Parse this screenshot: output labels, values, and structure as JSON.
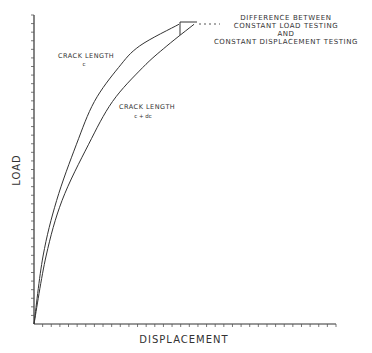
{
  "chart_data": {
    "type": "line",
    "title": "",
    "xlabel": "DISPLACEMENT",
    "ylabel": "LOAD",
    "xlim": [
      0,
      1
    ],
    "ylim": [
      0,
      1
    ],
    "grid": false,
    "x_tick_count": 35,
    "y_tick_count": 36,
    "series": [
      {
        "name": "crack-length-c",
        "label_line1": "CRACK LENGTH",
        "label_line2": "c",
        "points": [
          [
            0,
            0
          ],
          [
            0.03,
            0.22
          ],
          [
            0.075,
            0.4
          ],
          [
            0.14,
            0.58
          ],
          [
            0.2,
            0.72
          ],
          [
            0.28,
            0.83
          ],
          [
            0.35,
            0.9
          ],
          [
            0.48,
            0.97
          ]
        ]
      },
      {
        "name": "crack-length-c-plus-dc",
        "label_line1": "CRACK LENGTH",
        "label_line2": "c + dc",
        "points": [
          [
            0,
            0
          ],
          [
            0.04,
            0.22
          ],
          [
            0.093,
            0.4
          ],
          [
            0.18,
            0.58
          ],
          [
            0.26,
            0.72
          ],
          [
            0.36,
            0.83
          ],
          [
            0.44,
            0.9
          ],
          [
            0.53,
            0.97
          ]
        ]
      }
    ],
    "annotation": {
      "lines": [
        "DIFFERENCE BETWEEN",
        "CONSTANT LOAD TESTING",
        "AND",
        "CONSTANT DISPLACEMENT TESTING"
      ]
    }
  }
}
